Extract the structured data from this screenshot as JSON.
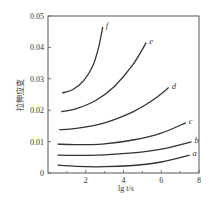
{
  "chart_data": {
    "type": "line",
    "title": "",
    "xlabel": "lg t/s",
    "ylabel": "拉伸应变",
    "xlim": [
      0,
      8
    ],
    "ylim": [
      0,
      0.05
    ],
    "x_ticks": [
      2,
      4,
      6,
      8
    ],
    "x_minor_ticks": [
      1,
      3,
      5,
      7
    ],
    "y_ticks": [
      0,
      0.01,
      0.02,
      0.03,
      0.04,
      0.05
    ],
    "y_tick_labels": [
      "0",
      "0.01",
      "0.02",
      "0.03",
      "0.04",
      "0.05"
    ],
    "grid": false,
    "legend": "inline curve labels at line ends",
    "series": [
      {
        "name": "a",
        "x": [
          0.5,
          1.5,
          3,
          4.5,
          6,
          7.5
        ],
        "values": [
          0.0025,
          0.0021,
          0.002,
          0.0024,
          0.0035,
          0.0057
        ]
      },
      {
        "name": "b",
        "x": [
          0.5,
          1.5,
          3,
          4.5,
          6,
          7.6
        ],
        "values": [
          0.0057,
          0.0056,
          0.0058,
          0.0064,
          0.0076,
          0.0099
        ]
      },
      {
        "name": "c",
        "x": [
          0.5,
          1.5,
          3,
          4.5,
          6,
          7.3
        ],
        "values": [
          0.0092,
          0.009,
          0.0093,
          0.0105,
          0.0127,
          0.016
        ]
      },
      {
        "name": "d",
        "x": [
          0.6,
          1.5,
          3,
          4.5,
          5.5,
          6.4
        ],
        "values": [
          0.0138,
          0.0142,
          0.016,
          0.0195,
          0.023,
          0.0272
        ]
      },
      {
        "name": "e",
        "x": [
          0.7,
          1.5,
          2.5,
          3.5,
          4.5,
          5.2
        ],
        "values": [
          0.0195,
          0.0205,
          0.023,
          0.0275,
          0.0345,
          0.0415
        ]
      },
      {
        "name": "f",
        "x": [
          0.75,
          1.3,
          1.9,
          2.4,
          2.7,
          2.9
        ],
        "values": [
          0.0255,
          0.0265,
          0.0295,
          0.0345,
          0.0405,
          0.0465
        ]
      }
    ]
  },
  "colors": {
    "line": "#333333",
    "axis": "#555555",
    "background": "#ffffff"
  }
}
